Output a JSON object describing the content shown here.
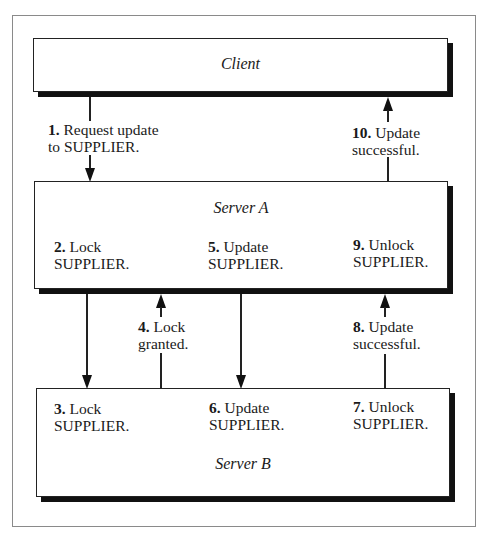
{
  "diagram": {
    "nodes": {
      "client": {
        "title": "Client"
      },
      "server_a": {
        "title": "Server A",
        "steps": [
          {
            "num": "2.",
            "text1": "Lock",
            "text2": "SUPPLIER."
          },
          {
            "num": "5.",
            "text1": "Update",
            "text2": "SUPPLIER."
          },
          {
            "num": "9.",
            "text1": "Unlock",
            "text2": "SUPPLIER."
          }
        ]
      },
      "server_b": {
        "title": "Server B",
        "steps": [
          {
            "num": "3.",
            "text1": "Lock",
            "text2": "SUPPLIER."
          },
          {
            "num": "6.",
            "text1": "Update",
            "text2": "SUPPLIER."
          },
          {
            "num": "7.",
            "text1": "Unlock",
            "text2": "SUPPLIER."
          }
        ]
      }
    },
    "edges": [
      {
        "id": "e1",
        "from": "Client",
        "to": "Server A",
        "num": "1.",
        "text1": "Request update",
        "text2": "to SUPPLIER."
      },
      {
        "id": "e10",
        "from": "Server A",
        "to": "Client",
        "num": "10.",
        "text1": "Update",
        "text2": "successful."
      },
      {
        "id": "e3",
        "from": "Server A",
        "to": "Server B",
        "step": "3"
      },
      {
        "id": "e4",
        "from": "Server B",
        "to": "Server A",
        "num": "4.",
        "text1": "Lock",
        "text2": "granted."
      },
      {
        "id": "e6",
        "from": "Server A",
        "to": "Server B",
        "step": "6"
      },
      {
        "id": "e8",
        "from": "Server B",
        "to": "Server A",
        "num": "8.",
        "text1": "Update",
        "text2": "successful."
      }
    ]
  }
}
